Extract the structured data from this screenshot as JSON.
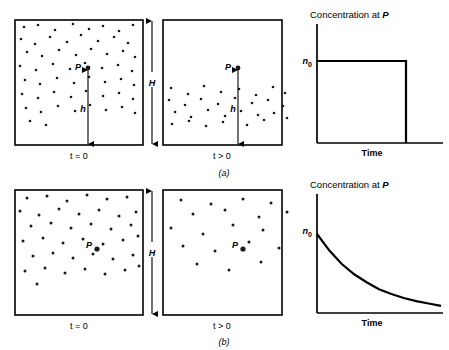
{
  "figure": {
    "width": 449,
    "height": 350,
    "background": "#ffffff",
    "ink": "#000000"
  },
  "panels": [
    {
      "tag": "(a)",
      "scenario": "sedimentation",
      "boxes": [
        {
          "time_label_parts": {
            "variable": "t",
            "relation": "= 0"
          },
          "time_label": "t = 0",
          "distribution": "uniform",
          "particle_count": 58,
          "point_label": "P",
          "distance_label": "h",
          "has_distance_arrow": true
        },
        {
          "time_label_parts": {
            "variable": "t",
            "relation": "> 0"
          },
          "time_label": "t > 0",
          "distribution": "settled-bottom",
          "particle_count": 30,
          "point_label": "P",
          "distance_label": "h",
          "has_distance_arrow": true
        }
      ],
      "height_label": "H",
      "chart": {
        "title_prefix": "Concentration at ",
        "title_symbol": "P",
        "title": "Concentration at P",
        "ylabel_symbol": "n",
        "ylabel_subscript": "0",
        "ylabel": "n0",
        "xlabel": "Time"
      }
    },
    {
      "tag": "(b)",
      "scenario": "dilution",
      "boxes": [
        {
          "time_label_parts": {
            "variable": "t",
            "relation": "= 0"
          },
          "time_label": "t = 0",
          "distribution": "uniform",
          "particle_count": 40,
          "point_label": "P",
          "distance_label": "",
          "has_distance_arrow": false
        },
        {
          "time_label_parts": {
            "variable": "t",
            "relation": "> 0"
          },
          "time_label": "t > 0",
          "distribution": "uniform-sparse",
          "particle_count": 19,
          "point_label": "P",
          "distance_label": "",
          "has_distance_arrow": false
        }
      ],
      "height_label": "H",
      "chart": {
        "title_prefix": "Concentration at ",
        "title_symbol": "P",
        "title": "Concentration at P",
        "ylabel_symbol": "n",
        "ylabel_subscript": "0",
        "ylabel": "n0",
        "xlabel": "Time"
      }
    }
  ],
  "chart_data": [
    {
      "type": "line",
      "panel": "(a)",
      "title": "Concentration at P",
      "xlabel": "Time",
      "ylabel": "n0",
      "shape": "step",
      "description": "Concentration stays constant at n0 then drops abruptly to zero",
      "x": [
        0,
        0.82,
        0.82,
        1.0
      ],
      "y": [
        1.0,
        1.0,
        0.0,
        0.0
      ],
      "xlim": [
        0,
        1.0
      ],
      "ylim": [
        0,
        1.18
      ],
      "yticks": [
        1.0
      ],
      "yticklabels": [
        "n0"
      ],
      "xticks": [],
      "xticklabels": [],
      "grid": false,
      "legend": false
    },
    {
      "type": "line",
      "panel": "(b)",
      "title": "Concentration at P",
      "xlabel": "Time",
      "ylabel": "n0",
      "shape": "exponential-decay",
      "description": "Concentration decays exponentially from n0 toward zero",
      "x": [
        0,
        0.1,
        0.2,
        0.3,
        0.4,
        0.5,
        0.6,
        0.7,
        0.8,
        0.9,
        1.0
      ],
      "y": [
        1.0,
        0.79,
        0.62,
        0.49,
        0.39,
        0.3,
        0.24,
        0.19,
        0.15,
        0.12,
        0.09
      ],
      "xlim": [
        0,
        1.0
      ],
      "ylim": [
        0,
        1.18
      ],
      "yticks": [
        1.0
      ],
      "yticklabels": [
        "n0"
      ],
      "xticks": [],
      "xticklabels": [],
      "grid": false,
      "legend": false
    }
  ],
  "particle_positions": {
    "a_left": [
      [
        9,
        7
      ],
      [
        23,
        5
      ],
      [
        40,
        10
      ],
      [
        58,
        4
      ],
      [
        74,
        9
      ],
      [
        88,
        6
      ],
      [
        104,
        11
      ],
      [
        118,
        5
      ],
      [
        6,
        19
      ],
      [
        20,
        24
      ],
      [
        35,
        17
      ],
      [
        52,
        22
      ],
      [
        66,
        15
      ],
      [
        83,
        21
      ],
      [
        99,
        17
      ],
      [
        113,
        23
      ],
      [
        12,
        32
      ],
      [
        27,
        36
      ],
      [
        44,
        30
      ],
      [
        61,
        35
      ],
      [
        76,
        29
      ],
      [
        92,
        34
      ],
      [
        108,
        31
      ],
      [
        120,
        37
      ],
      [
        5,
        46
      ],
      [
        21,
        50
      ],
      [
        38,
        44
      ],
      [
        55,
        49
      ],
      [
        70,
        43
      ],
      [
        87,
        48
      ],
      [
        103,
        45
      ],
      [
        117,
        51
      ],
      [
        10,
        60
      ],
      [
        25,
        64
      ],
      [
        42,
        58
      ],
      [
        59,
        63
      ],
      [
        74,
        57
      ],
      [
        90,
        62
      ],
      [
        106,
        59
      ],
      [
        119,
        65
      ],
      [
        7,
        74
      ],
      [
        23,
        78
      ],
      [
        39,
        72
      ],
      [
        56,
        77
      ],
      [
        71,
        71
      ],
      [
        88,
        76
      ],
      [
        104,
        73
      ],
      [
        118,
        79
      ],
      [
        11,
        88
      ],
      [
        26,
        92
      ],
      [
        43,
        86
      ],
      [
        60,
        91
      ],
      [
        75,
        85
      ],
      [
        91,
        90
      ],
      [
        107,
        87
      ],
      [
        120,
        93
      ],
      [
        15,
        101
      ],
      [
        31,
        105
      ]
    ],
    "a_right": [
      [
        8,
        68
      ],
      [
        25,
        74
      ],
      [
        41,
        66
      ],
      [
        58,
        72
      ],
      [
        76,
        69
      ],
      [
        93,
        75
      ],
      [
        110,
        67
      ],
      [
        122,
        73
      ],
      [
        6,
        80
      ],
      [
        22,
        85
      ],
      [
        38,
        79
      ],
      [
        55,
        84
      ],
      [
        72,
        78
      ],
      [
        89,
        83
      ],
      [
        105,
        80
      ],
      [
        120,
        86
      ],
      [
        12,
        92
      ],
      [
        28,
        97
      ],
      [
        45,
        90
      ],
      [
        62,
        96
      ],
      [
        78,
        91
      ],
      [
        95,
        95
      ],
      [
        111,
        93
      ],
      [
        124,
        98
      ],
      [
        9,
        104
      ],
      [
        26,
        101
      ],
      [
        43,
        106
      ],
      [
        60,
        102
      ],
      [
        84,
        105
      ],
      [
        101,
        100
      ]
    ],
    "b_left": [
      [
        12,
        8
      ],
      [
        32,
        6
      ],
      [
        52,
        11
      ],
      [
        72,
        5
      ],
      [
        92,
        9
      ],
      [
        112,
        7
      ],
      [
        5,
        21
      ],
      [
        24,
        25
      ],
      [
        44,
        19
      ],
      [
        64,
        24
      ],
      [
        84,
        20
      ],
      [
        104,
        26
      ],
      [
        121,
        22
      ],
      [
        16,
        36
      ],
      [
        36,
        33
      ],
      [
        56,
        38
      ],
      [
        76,
        34
      ],
      [
        96,
        39
      ],
      [
        116,
        35
      ],
      [
        8,
        51
      ],
      [
        28,
        48
      ],
      [
        48,
        53
      ],
      [
        68,
        49
      ],
      [
        88,
        54
      ],
      [
        108,
        50
      ],
      [
        123,
        46
      ],
      [
        18,
        66
      ],
      [
        38,
        63
      ],
      [
        58,
        68
      ],
      [
        78,
        64
      ],
      [
        98,
        69
      ],
      [
        118,
        65
      ],
      [
        10,
        81
      ],
      [
        30,
        78
      ],
      [
        50,
        83
      ],
      [
        70,
        79
      ],
      [
        90,
        84
      ],
      [
        110,
        80
      ],
      [
        124,
        76
      ],
      [
        22,
        94
      ]
    ],
    "b_right": [
      [
        18,
        10
      ],
      [
        48,
        14
      ],
      [
        80,
        9
      ],
      [
        108,
        13
      ],
      [
        30,
        24
      ],
      [
        62,
        20
      ],
      [
        96,
        27
      ],
      [
        124,
        22
      ],
      [
        8,
        38
      ],
      [
        40,
        44
      ],
      [
        70,
        35
      ],
      [
        100,
        40
      ],
      [
        20,
        56
      ],
      [
        52,
        61
      ],
      [
        86,
        52
      ],
      [
        116,
        58
      ],
      [
        34,
        74
      ],
      [
        66,
        80
      ],
      [
        98,
        72
      ]
    ]
  }
}
